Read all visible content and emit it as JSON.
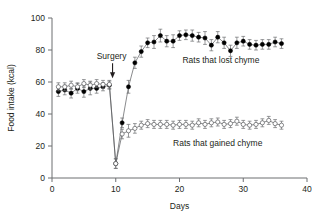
{
  "chart_data": {
    "type": "scatter",
    "title": "",
    "subtitle": "",
    "xlabel": "Days",
    "ylabel": "Food intake (kcal)",
    "xlim": [
      0,
      40
    ],
    "ylim": [
      0,
      100
    ],
    "xticks": [
      0,
      10,
      20,
      30,
      40
    ],
    "yticks": [
      0,
      20,
      40,
      60,
      80,
      100
    ],
    "grid": false,
    "legend_position": "inline-annotation",
    "annotations": [
      {
        "text": "Surgery",
        "x": 9.5,
        "y": 68,
        "marker": "down-arrow"
      }
    ],
    "series": [
      {
        "name": "Rats that lost chyme",
        "marker": "filled-circle",
        "color": "#000000",
        "label_x": 26.5,
        "label_y": 72,
        "x": [
          1,
          2,
          3,
          4,
          5,
          6,
          7,
          8,
          9,
          10,
          11,
          12,
          13,
          14,
          15,
          16,
          17,
          18,
          19,
          20,
          21,
          22,
          23,
          24,
          25,
          26,
          27,
          28,
          29,
          30,
          31,
          32,
          33,
          34,
          35,
          36
        ],
        "y": [
          54,
          55,
          53,
          56,
          54,
          56,
          56,
          57,
          58,
          9,
          34.5,
          57,
          72,
          79,
          84.5,
          85,
          89,
          85.5,
          85.5,
          89,
          89.5,
          89,
          88,
          87.5,
          83,
          88,
          84.5,
          79.5,
          84.5,
          85.5,
          83.5,
          83,
          83.5,
          83.5,
          85,
          84
        ],
        "yerr": [
          3,
          3,
          3,
          3,
          3.5,
          4,
          3,
          2.5,
          2.5,
          3,
          3,
          4,
          3.5,
          3.5,
          3,
          4,
          4,
          3.5,
          4,
          3,
          3,
          3.5,
          3,
          4,
          3.5,
          3.5,
          3.5,
          3.5,
          3.5,
          3,
          3,
          3,
          3,
          3,
          3,
          3
        ]
      },
      {
        "name": "Rats that gained chyme",
        "marker": "open-circle",
        "color": "#58595b",
        "label_x": 26.0,
        "label_y": 20,
        "x": [
          1,
          2,
          3,
          4,
          5,
          6,
          7,
          8,
          9,
          10,
          11,
          12,
          13,
          14,
          15,
          16,
          17,
          18,
          19,
          20,
          21,
          22,
          23,
          24,
          25,
          26,
          27,
          28,
          29,
          30,
          31,
          32,
          33,
          34,
          35,
          36
        ],
        "y": [
          57,
          57,
          58,
          57,
          59,
          58,
          59,
          58.5,
          58.5,
          9,
          27.5,
          29.5,
          31,
          33,
          34,
          33.5,
          33.5,
          33.5,
          33,
          33.5,
          33.5,
          33,
          34.5,
          33.5,
          34.5,
          35,
          33.5,
          34,
          35.5,
          33.5,
          33,
          33.5,
          34.5,
          36,
          34,
          33
        ],
        "yerr": [
          2.5,
          2.5,
          2.5,
          2.5,
          2.5,
          2.5,
          2.5,
          2.5,
          2.5,
          3,
          3,
          4,
          3,
          2.5,
          2.5,
          2.5,
          2.5,
          2.5,
          2.5,
          2.5,
          2.5,
          2.5,
          2.5,
          2.5,
          2.5,
          2.5,
          2.5,
          2.5,
          2.5,
          2.5,
          2.5,
          2.5,
          2.5,
          2.5,
          2.5,
          2.5
        ]
      }
    ]
  }
}
